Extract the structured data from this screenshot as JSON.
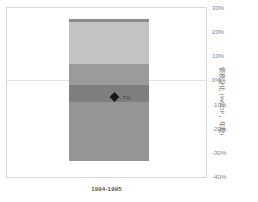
{
  "chart_data": {
    "type": "bar",
    "title": "",
    "subtitle": "",
    "xlabel": "",
    "ylabel": "債務變化 (%GDP，年增)",
    "categories": [
      "1994-1995"
    ],
    "ylim": [
      -40,
      30
    ],
    "yticks": [
      30,
      20,
      10,
      0,
      -10,
      -20,
      -30,
      -40
    ],
    "ytick_labels": [
      "30%",
      "20%",
      "10%",
      "0%",
      "-10%",
      "-20%",
      "-30%",
      "-40%"
    ],
    "grid": true,
    "gridlines": [
      0
    ],
    "legend_position": "none",
    "stacked": true,
    "bands": [
      {
        "name": "band-cap",
        "from": 24.2,
        "to": 25.4,
        "color": "#8d8d8d"
      },
      {
        "name": "band-upper",
        "from": 7.0,
        "to": 24.2,
        "color": "#c3c3c3"
      },
      {
        "name": "band-mid",
        "from": -2.0,
        "to": 7.0,
        "color": "#9b9b9b"
      },
      {
        "name": "band-lower",
        "from": -9.0,
        "to": -2.0,
        "color": "#7f7f7f"
      },
      {
        "name": "band-bottom",
        "from": -33.2,
        "to": -9.0,
        "color": "#959595"
      }
    ],
    "markers": [
      {
        "name": "net-change",
        "category": "1994-1995",
        "value": -7,
        "label": "-7%",
        "shape": "diamond",
        "color": "#1a1a1a"
      }
    ],
    "annotations": []
  },
  "axis": {
    "y_tick_0": "30%",
    "y_tick_1": "20%",
    "y_tick_2": "10%",
    "y_tick_3": "0%",
    "y_tick_4": "-10%",
    "y_tick_5": "-20%",
    "y_tick_6": "-30%",
    "y_tick_7": "-40%",
    "y_title": "債務變化 (%GDP，年增)",
    "x_category_0": "1994-1995"
  },
  "marker": {
    "label": "-7%"
  },
  "colors": {
    "frame": "#d8d8d8",
    "gridline": "#e2e2e2",
    "tick_text": "#7d7d7d",
    "axis_title_text": "#6f6f6f",
    "xlabel_text": "#555555",
    "marker": "#1a1a1a",
    "band_cap": "#8d8d8d",
    "band_upper": "#c3c3c3",
    "band_mid": "#9b9b9b",
    "band_lower": "#7f7f7f",
    "band_bottom": "#959595",
    "background": "#ffffff"
  }
}
